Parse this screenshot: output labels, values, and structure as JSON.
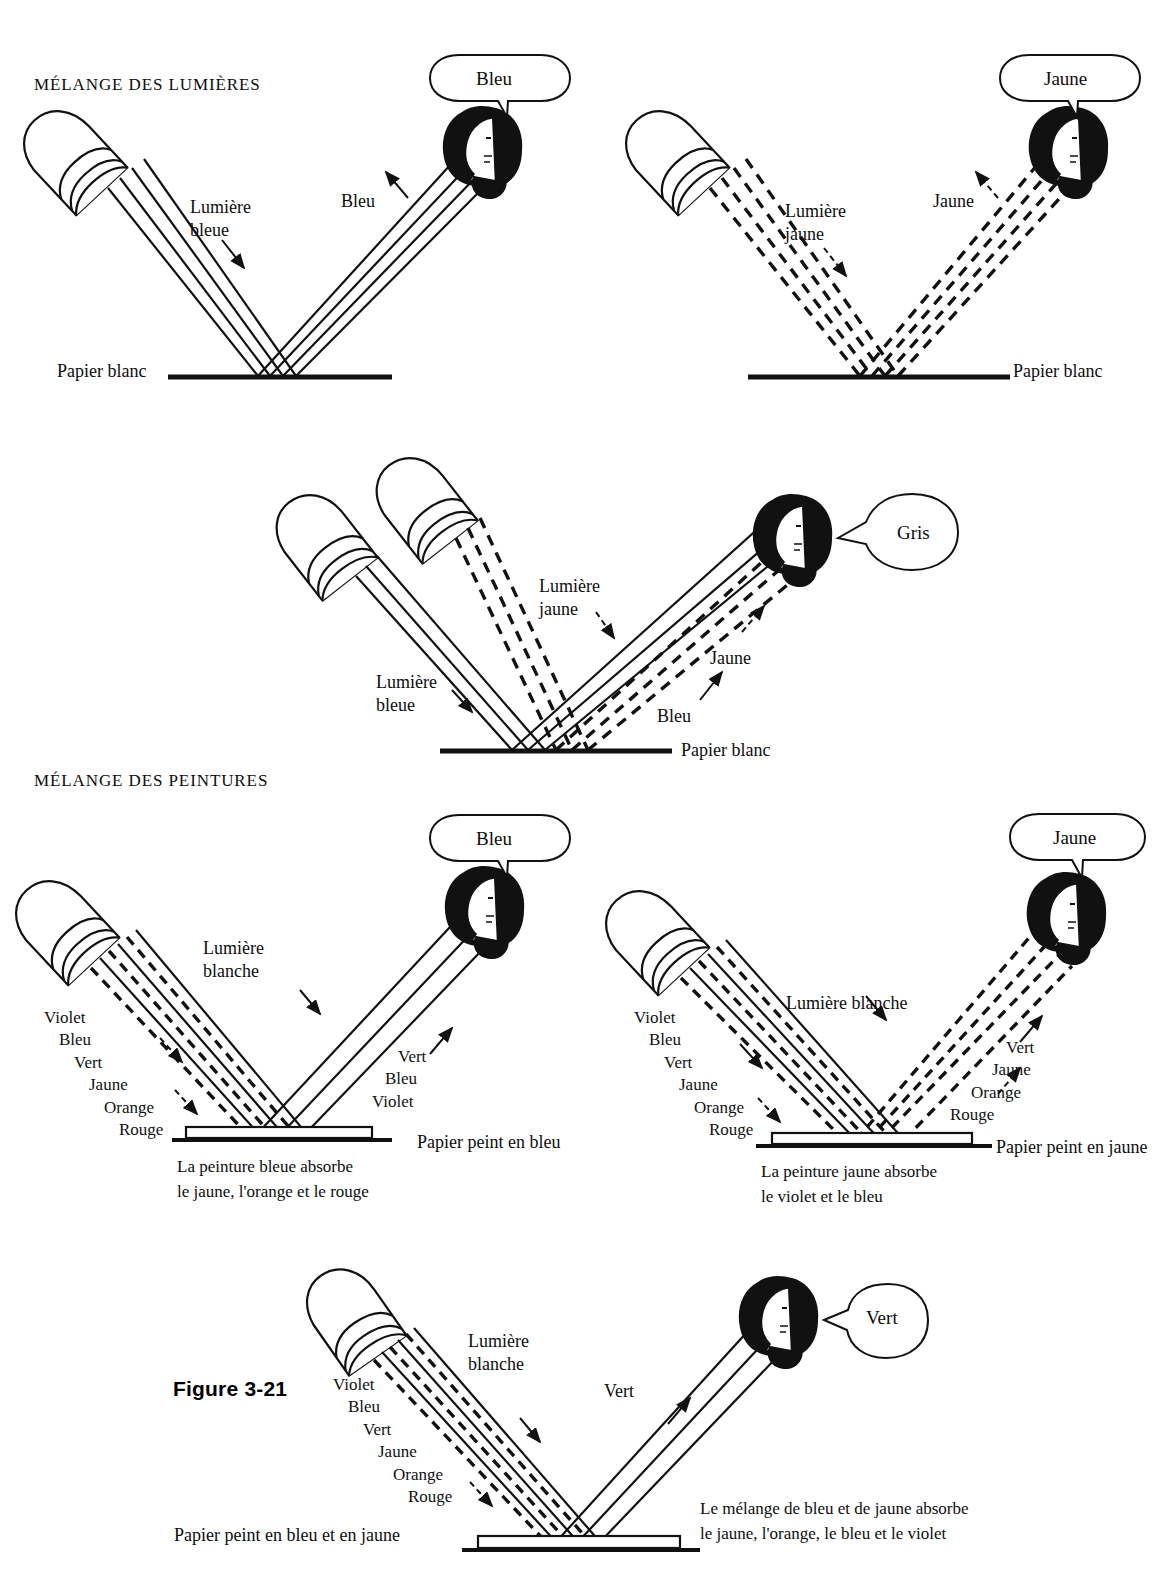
{
  "figure": {
    "number_label": "Figure 3-21",
    "sections": [
      {
        "id": "lumieres",
        "heading": "MÉLANGE DES LUMIÈRES"
      },
      {
        "id": "peintures",
        "heading": "MÉLANGE DES PEINTURES"
      }
    ]
  },
  "panels": [
    {
      "id": "blue-light",
      "section": "lumieres",
      "bubble": "Bleu",
      "incoming_label": "Lumière\nbleue",
      "outgoing_label": "Bleu",
      "surface_label": "Papier blanc",
      "incoming_style": "solid",
      "outgoing_style": "solid"
    },
    {
      "id": "yellow-light",
      "section": "lumieres",
      "bubble": "Jaune",
      "incoming_label": "Lumière\njaune",
      "outgoing_label": "Jaune",
      "surface_label": "Papier blanc",
      "incoming_style": "dashed",
      "outgoing_style": "dashed"
    },
    {
      "id": "blue-plus-yellow-light",
      "section": "lumieres",
      "bubble": "Gris",
      "incoming_label_1": "Lumière\njaune",
      "incoming_label_2": "Lumière\nbleue",
      "outgoing_label_1": "Jaune",
      "outgoing_label_2": "Bleu",
      "surface_label": "Papier blanc",
      "projectors": 2
    },
    {
      "id": "blue-paint",
      "section": "peintures",
      "bubble": "Bleu",
      "incoming_label": "Lumière\nblanche",
      "incoming_spectrum": [
        "Violet",
        "Bleu",
        "Vert",
        "Jaune",
        "Orange",
        "Rouge"
      ],
      "outgoing_spectrum": [
        "Vert",
        "Bleu",
        "Violet"
      ],
      "surface_label": "Papier peint en bleu",
      "caption": "La peinture bleue absorbe\nle jaune, l'orange et le rouge"
    },
    {
      "id": "yellow-paint",
      "section": "peintures",
      "bubble": "Jaune",
      "incoming_label": "Lumière blanche",
      "incoming_spectrum": [
        "Violet",
        "Bleu",
        "Vert",
        "Jaune",
        "Orange",
        "Rouge"
      ],
      "outgoing_spectrum": [
        "Vert",
        "Jaune",
        "Orange",
        "Rouge"
      ],
      "surface_label": "Papier peint en jaune",
      "caption": "La peinture jaune absorbe\nle violet et le bleu"
    },
    {
      "id": "blue-and-yellow-paint",
      "section": "peintures",
      "bubble": "Vert",
      "incoming_label": "Lumière\nblanche",
      "incoming_spectrum": [
        "Violet",
        "Bleu",
        "Vert",
        "Jaune",
        "Orange",
        "Rouge"
      ],
      "outgoing_label": "Vert",
      "surface_label": "Papier peint en bleu et en jaune",
      "caption": "Le mélange de bleu et de jaune absorbe\nle jaune, l'orange, le bleu et le violet"
    }
  ],
  "colors": {
    "ink": "#111111",
    "paper": "#ffffff"
  }
}
